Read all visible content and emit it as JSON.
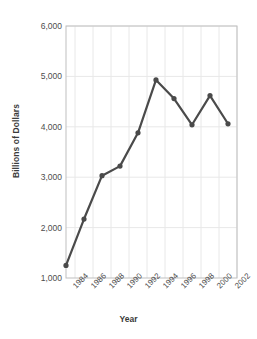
{
  "chart_data": {
    "type": "line",
    "title": "",
    "xlabel": "Year",
    "ylabel": "Billions of Dollars",
    "xlim": [
      1983,
      2002
    ],
    "ylim": [
      1000,
      6000
    ],
    "ytick_labels": [
      "6,000",
      "5,000",
      "4,000",
      "3,000",
      "2,000",
      "1,000"
    ],
    "ytick_values": [
      6000,
      5000,
      4000,
      3000,
      2000,
      1000
    ],
    "xtick_labels": [
      "1984",
      "1986",
      "1988",
      "1990",
      "1992",
      "1994",
      "1996",
      "1998",
      "2000",
      "2002"
    ],
    "xtick_values": [
      1984,
      1986,
      1988,
      1990,
      1992,
      1994,
      1996,
      1998,
      2000,
      2002
    ],
    "x": [
      1983,
      1985,
      1987,
      1989,
      1991,
      1993,
      1995,
      1997,
      1999,
      2001
    ],
    "values": [
      1250,
      2170,
      3030,
      3220,
      3880,
      4930,
      4560,
      4040,
      4620,
      4060
    ],
    "series": [
      {
        "name": "Billions of Dollars",
        "color": "#4a4a4a",
        "marker": "circle",
        "points": [
          {
            "x": 1983,
            "y": 1250
          },
          {
            "x": 1985,
            "y": 2170
          },
          {
            "x": 1987,
            "y": 3030
          },
          {
            "x": 1989,
            "y": 3220
          },
          {
            "x": 1991,
            "y": 3880
          },
          {
            "x": 1993,
            "y": 4930
          },
          {
            "x": 1995,
            "y": 4560
          },
          {
            "x": 1997,
            "y": 4040
          },
          {
            "x": 1999,
            "y": 4620
          },
          {
            "x": 2001,
            "y": 4060
          }
        ]
      }
    ],
    "grid": true,
    "grid_color": "#e8e8e8",
    "legend": "none",
    "line_color": "#4a4a4a",
    "background": "#ffffff",
    "axis_color": "#bfbfbf"
  }
}
